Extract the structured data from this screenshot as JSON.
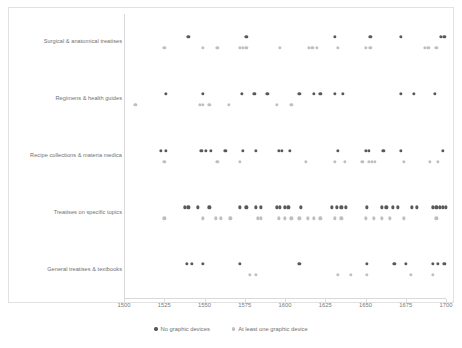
{
  "chart_data": {
    "type": "scatter",
    "title": "",
    "subtitle": "",
    "xlabel": "",
    "ylabel": "",
    "xlim": [
      1500,
      1700
    ],
    "xticks": [
      1500,
      1525,
      1550,
      1575,
      1600,
      1625,
      1650,
      1675,
      1700
    ],
    "xticklabels": [
      "1500",
      "1525",
      "1550",
      "1575",
      "1600",
      "1625",
      "1650",
      "1675",
      "1700"
    ],
    "grid": false,
    "legend_position": "bottom",
    "categories": [
      "Surgical & anatomical treatises",
      "Regimens & health guides",
      "Recipe collections & materia medica",
      "Treatises on specific topics",
      "General treatises & textbooks"
    ],
    "series": [
      {
        "name": "No graphic devices",
        "color": "#595959",
        "points_by_category": {
          "Surgical & anatomical treatises": [
            1540,
            1576,
            1631,
            1653,
            1672,
            1697,
            1699
          ],
          "Regimens & health guides": [
            1526,
            1549,
            1573,
            1581,
            1589,
            1609,
            1618,
            1622,
            1631,
            1636,
            1672,
            1680,
            1693
          ],
          "Recipe collections & materia medica": [
            1523,
            1526,
            1548,
            1551,
            1554,
            1563,
            1574,
            1582,
            1596,
            1598,
            1603,
            1633,
            1650,
            1652,
            1661,
            1672,
            1698
          ],
          "Treatises on specific topics": [
            1538,
            1540,
            1546,
            1553,
            1572,
            1576,
            1582,
            1585,
            1595,
            1597,
            1600,
            1602,
            1610,
            1629,
            1632,
            1635,
            1638,
            1651,
            1660,
            1663,
            1667,
            1670,
            1679,
            1682,
            1692,
            1694,
            1696,
            1698,
            1700
          ],
          "General treatises & textbooks": [
            1539,
            1542,
            1549,
            1572,
            1609,
            1651,
            1668,
            1675,
            1692,
            1695,
            1699
          ]
        }
      },
      {
        "name": "At least one graphic device",
        "color": "#bfbfbf",
        "points_by_category": {
          "Surgical & anatomical treatises": [
            1525,
            1549,
            1558,
            1572,
            1574,
            1576,
            1597,
            1615,
            1617,
            1620,
            1633,
            1650,
            1653,
            1687,
            1689,
            1694
          ],
          "Regimens & health guides": [
            1507,
            1547,
            1549,
            1553,
            1565,
            1595,
            1604
          ],
          "Recipe collections & materia medica": [
            1525,
            1558,
            1572,
            1613,
            1631,
            1637,
            1648,
            1652,
            1654,
            1656,
            1674,
            1690,
            1695
          ],
          "Treatises on specific topics": [
            1525,
            1549,
            1557,
            1560,
            1566,
            1583,
            1585,
            1596,
            1600,
            1604,
            1609,
            1614,
            1618,
            1622,
            1631,
            1635,
            1650,
            1655,
            1660,
            1665,
            1674,
            1694
          ],
          "General treatises & textbooks": [
            1578,
            1582,
            1633,
            1641,
            1651,
            1678,
            1692
          ]
        }
      }
    ]
  },
  "legend": {
    "entries": [
      {
        "label": "No graphic devices"
      },
      {
        "label": "At least one graphic device"
      }
    ]
  }
}
